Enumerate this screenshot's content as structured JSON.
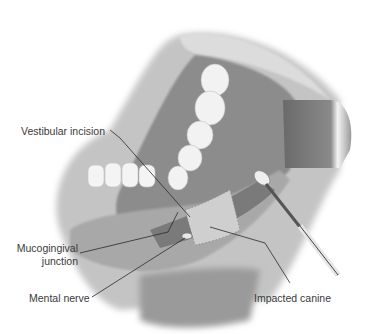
{
  "figure": {
    "labels": {
      "vestibular_incision": "Vestibular incision",
      "mucogingival_line1": "Mucogingival",
      "mucogingival_line2": "junction",
      "mental_nerve": "Mental nerve",
      "impacted_canine": "Impacted canine"
    }
  }
}
